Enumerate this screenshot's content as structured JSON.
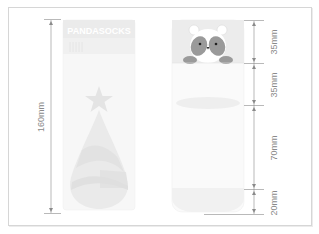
{
  "diagram": {
    "type": "sock-size-spec",
    "colors": {
      "frame": "#d6d6d6",
      "line": "#8a8a8a",
      "sock_light": "#f4f4f4",
      "sock_band": "#ececec",
      "shape_fill": "#e6e6e6",
      "panda_dark": "#9a9a9a"
    },
    "left_sock": {
      "logo_text": "PANDASOCKS",
      "total_length": "160mm"
    },
    "right_sock": {
      "segments": [
        {
          "label": "35mm"
        },
        {
          "label": "35mm"
        },
        {
          "label": "70mm"
        },
        {
          "label": "20mm"
        }
      ]
    }
  }
}
